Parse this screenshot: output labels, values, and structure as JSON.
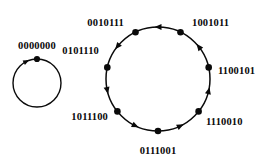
{
  "figure": {
    "title": "",
    "background_color": "#ffffff",
    "ink_color": "#0a0a0a",
    "width": 272,
    "height": 168
  },
  "chart_data": {
    "type": "diagram",
    "subtype": "state-cycle-graph",
    "title": "",
    "xlabel": "",
    "ylabel": "",
    "grid": false,
    "legend": null,
    "cycles": [
      {
        "id": "fixed-point-cycle",
        "name": "0000000",
        "length": 1,
        "direction": "clockwise",
        "center": [
          37,
          83
        ],
        "radius": 24,
        "states": [
          {
            "label": "0000000",
            "angle_deg": 90,
            "dot": [
              37,
              59
            ],
            "label_pos": [
              37,
              47
            ],
            "label_anchor": "middle"
          }
        ],
        "arrows": [
          {
            "angle_deg": 116,
            "direction": "clockwise"
          }
        ]
      },
      {
        "id": "main-cycle",
        "name": "7-state cycle",
        "length": 7,
        "direction": "counterclockwise",
        "center": [
          158,
          79
        ],
        "radius": 52,
        "states": [
          {
            "label": "0010111",
            "angle_deg": 115.7,
            "dot": [
              135.5,
              32.2
            ],
            "label_pos": [
              124,
              24
            ],
            "label_anchor": "end"
          },
          {
            "label": "1001011",
            "angle_deg": 64.3,
            "dot": [
              180.5,
              32.2
            ],
            "label_pos": [
              192,
              24
            ],
            "label_anchor": "start"
          },
          {
            "label": "1100101",
            "angle_deg": 12.9,
            "dot": [
              208.7,
              67.4
            ],
            "label_pos": [
              218,
              72
            ],
            "label_anchor": "start"
          },
          {
            "label": "1110010",
            "angle_deg": -38.6,
            "dot": [
              198.6,
              111.4
            ],
            "label_pos": [
              206,
              123
            ],
            "label_anchor": "start"
          },
          {
            "label": "0111001",
            "angle_deg": -90.0,
            "dot": [
              158.0,
              131.0
            ],
            "label_pos": [
              158,
              152
            ],
            "label_anchor": "middle"
          },
          {
            "label": "1011100",
            "angle_deg": -141.4,
            "dot": [
              117.4,
              111.4
            ],
            "label_pos": [
              108,
              118
            ],
            "label_anchor": "end"
          },
          {
            "label": "0101110",
            "angle_deg": 167.1,
            "dot": [
              107.3,
              67.4
            ],
            "label_pos": [
              99,
              52
            ],
            "label_anchor": "end"
          }
        ],
        "arrows": [
          {
            "angle_deg": 90.0,
            "direction": "counterclockwise"
          },
          {
            "angle_deg": 38.6,
            "direction": "counterclockwise"
          },
          {
            "angle_deg": -12.9,
            "direction": "counterclockwise"
          },
          {
            "angle_deg": -64.3,
            "direction": "counterclockwise"
          },
          {
            "angle_deg": -115.7,
            "direction": "counterclockwise"
          },
          {
            "angle_deg": -167.1,
            "direction": "counterclockwise"
          },
          {
            "angle_deg": 141.4,
            "direction": "counterclockwise"
          }
        ]
      }
    ],
    "all_state_labels": [
      "0000000",
      "0010111",
      "1001011",
      "1100101",
      "1110010",
      "0111001",
      "1011100",
      "0101110"
    ]
  }
}
